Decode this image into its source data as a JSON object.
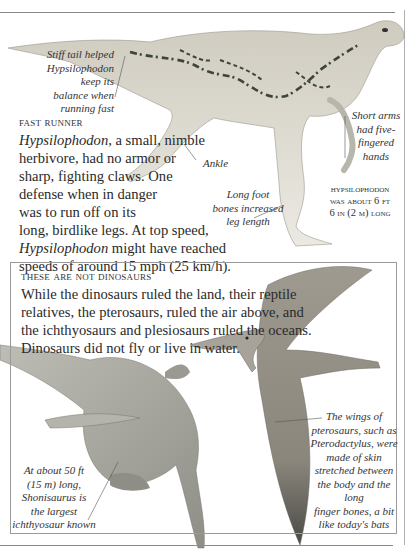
{
  "top_section": {
    "captions": {
      "tail": [
        "Stiff tail helped",
        "Hypsilophodon keep its",
        "balance when running fast"
      ],
      "arms": [
        "Short arms",
        "had five-",
        "fingered",
        "hands"
      ],
      "ankle": "Ankle",
      "foot": [
        "Long foot",
        "bones increased",
        "leg length"
      ],
      "length": [
        "Hypsilophodon",
        "was about 6 ft",
        "6 in (2 m) long"
      ]
    },
    "heading": "Fast runner",
    "body": {
      "l1_em": "Hypsilophodon",
      "l1_rest": ", a small, nimble",
      "l2": "herbivore, had no armor or",
      "l3": "sharp, fighting claws. One",
      "l4": "defense when in danger",
      "l5": "was to run off on its",
      "l6": "long, birdlike legs. At top speed,",
      "l7_em": "Hypsilophodon",
      "l7_rest": " might have reached",
      "l8": "speeds of around 15 mph (25 km/h)."
    }
  },
  "box_section": {
    "heading": "These are not dinosaurs",
    "body": [
      "While the dinosaurs ruled the land, their reptile",
      "relatives, the pterosaurs, ruled the air above, and",
      "the ichthyosaurs and plesiosaurs ruled the oceans.",
      "Dinosaurs did not fly or live in water."
    ],
    "captions": {
      "ichthyosaur": [
        "At about 50 ft",
        "(15 m) long,",
        "Shonisaurus is",
        "the largest",
        "ichthyosaur known"
      ],
      "pterosaur": [
        "The wings of",
        "pterosaurs, such as",
        "Pterodactylus, were",
        "made of skin",
        "stretched between",
        "the body and the long",
        "finger bones, a bit",
        "like today's bats"
      ]
    }
  },
  "colors": {
    "dino_body": "#d9d6cc",
    "dino_pattern": "#3d4438",
    "pterosaur": "#8e8a80",
    "ichthyosaur": "#a3a39c"
  }
}
